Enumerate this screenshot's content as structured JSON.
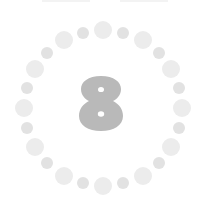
{
  "loader": {
    "digit": "8",
    "digit_color": "#b9b9b9",
    "hole_color": "#ffffff",
    "center": [
      103,
      108
    ],
    "radius": 79,
    "dots": {
      "count": 24,
      "large_color": "#ececec",
      "small_color": "#e2e2e2",
      "large_radius": 9,
      "small_radius": 6
    }
  },
  "top_edge": {
    "segments": [
      [
        42,
        90
      ],
      [
        120,
        168
      ]
    ],
    "color": "#f3f3f3"
  }
}
